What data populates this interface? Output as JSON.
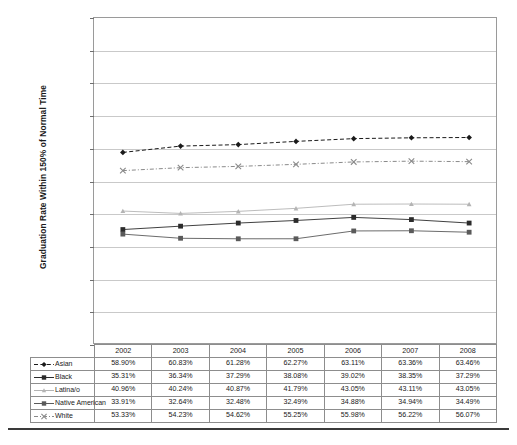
{
  "chart_data": {
    "type": "line",
    "title": "",
    "xlabel": "",
    "ylabel": "Graduation Rate Within 150% of Normal Time",
    "ylim": [
      0,
      100
    ],
    "ytick_labels": [
      "100%",
      "90%",
      "80%",
      "70%",
      "60%",
      "50%",
      "40%",
      "30%",
      "20%",
      "10%",
      "0%"
    ],
    "ytick_values": [
      100,
      90,
      80,
      70,
      60,
      50,
      40,
      30,
      20,
      10,
      0
    ],
    "grid": true,
    "legend_position": "table-left",
    "categories": [
      "2002",
      "2003",
      "2004",
      "2005",
      "2006",
      "2007",
      "2008"
    ],
    "series": [
      {
        "name": "Asian",
        "marker": "diamond",
        "line_style": "dashed",
        "color": "#1a1a1a",
        "values": [
          58.9,
          60.83,
          61.28,
          62.27,
          63.11,
          63.36,
          63.46
        ],
        "labels": [
          "58.90%",
          "60.83%",
          "61.28%",
          "62.27%",
          "63.11%",
          "63.36%",
          "63.46%"
        ]
      },
      {
        "name": "Black",
        "marker": "square",
        "line_style": "solid",
        "color": "#2b2b2b",
        "values": [
          35.31,
          36.34,
          37.29,
          38.08,
          39.02,
          38.35,
          37.29
        ],
        "labels": [
          "35.31%",
          "36.34%",
          "37.29%",
          "38.08%",
          "39.02%",
          "38.35%",
          "37.29%"
        ]
      },
      {
        "name": "Latina/o",
        "marker": "triangle",
        "line_style": "solid",
        "color": "#b4b4b4",
        "values": [
          40.96,
          40.24,
          40.87,
          41.79,
          43.05,
          43.11,
          43.05
        ],
        "labels": [
          "40.96%",
          "40.24%",
          "40.87%",
          "41.79%",
          "43.05%",
          "43.11%",
          "43.05%"
        ]
      },
      {
        "name": "Native American",
        "marker": "square",
        "line_style": "solid",
        "color": "#5a5a5a",
        "values": [
          33.91,
          32.64,
          32.48,
          32.49,
          34.88,
          34.94,
          34.49
        ],
        "labels": [
          "33.91%",
          "32.64%",
          "32.48%",
          "32.49%",
          "34.88%",
          "34.94%",
          "34.49%"
        ]
      },
      {
        "name": "White",
        "marker": "x",
        "line_style": "dash-dot",
        "color": "#8a8a8a",
        "values": [
          53.33,
          54.23,
          54.62,
          55.25,
          55.98,
          56.22,
          56.07
        ],
        "labels": [
          "53.33%",
          "54.23%",
          "54.62%",
          "55.25%",
          "55.98%",
          "56.22%",
          "56.07%"
        ]
      }
    ]
  },
  "footer": {
    "note": ""
  }
}
